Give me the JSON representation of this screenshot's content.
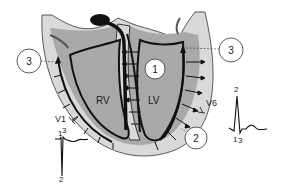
{
  "diagram": {
    "type": "heart-ventricle-depolarization",
    "chambers": {
      "rv_label": "RV",
      "lv_label": "LV"
    },
    "callouts": [
      {
        "id": "callout-1",
        "label": "1"
      },
      {
        "id": "callout-2",
        "label": "2"
      },
      {
        "id": "callout-3-left",
        "label": "3"
      },
      {
        "id": "callout-3-right",
        "label": "3"
      }
    ],
    "leads": {
      "v1": {
        "label": "V1",
        "wave_labels": {
          "start": "1",
          "peak": "3",
          "nadir": "2"
        }
      },
      "v6": {
        "label": "V6",
        "wave_labels": {
          "peak": "2",
          "start": "1",
          "end": "3"
        }
      }
    },
    "colors": {
      "outer_tissue": "#d9d9d9",
      "cavity": "#a9a9a9",
      "outline": "#111111",
      "background": "#ffffff"
    }
  }
}
